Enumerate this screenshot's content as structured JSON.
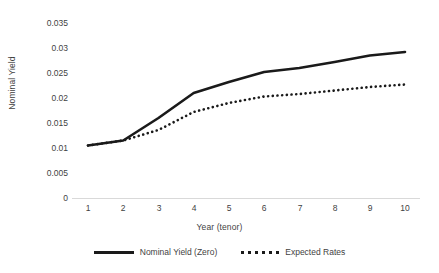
{
  "chart_data": {
    "type": "line",
    "title": "",
    "xlabel": "Year (tenor)",
    "ylabel": "Nominal Yield",
    "x": [
      1,
      2,
      3,
      4,
      5,
      6,
      7,
      8,
      9,
      10
    ],
    "xticklabels": [
      "1",
      "2",
      "3",
      "4",
      "5",
      "6",
      "7",
      "8",
      "9",
      "10"
    ],
    "yticklabels": [
      "0.035",
      "0.03",
      "0.025",
      "0.02",
      "0.015",
      "0.01",
      "0.005",
      "0"
    ],
    "ytickvalues": [
      0.035,
      0.03,
      0.025,
      0.02,
      0.015,
      0.01,
      0.005,
      0
    ],
    "xlim": [
      1,
      10
    ],
    "ylim": [
      0,
      0.035
    ],
    "grid": false,
    "legend_position": "bottom",
    "series": [
      {
        "name": "Nominal Yield (Zero)",
        "style": "solid",
        "color": "#1a1a1a",
        "values": [
          0.0105,
          0.0115,
          0.016,
          0.021,
          0.0232,
          0.0252,
          0.026,
          0.0272,
          0.0285,
          0.0292
        ]
      },
      {
        "name": "Expected Rates",
        "style": "dotted",
        "color": "#1a1a1a",
        "values": [
          0.0105,
          0.0115,
          0.0136,
          0.0172,
          0.019,
          0.0203,
          0.0208,
          0.0215,
          0.0222,
          0.0227
        ]
      }
    ]
  },
  "legend": {
    "items": [
      {
        "label": "Nominal Yield (Zero)"
      },
      {
        "label": "Expected Rates"
      }
    ]
  },
  "axes": {
    "x_title": "Year (tenor)",
    "y_title": "Nominal Yield"
  }
}
